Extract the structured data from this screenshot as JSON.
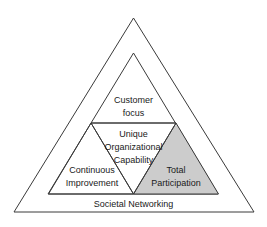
{
  "diagram": {
    "background_color": "#ffffff",
    "stroke_color": "#3a3a3a",
    "text_color": "#1a1a1a",
    "shaded_fill_color": "#cccccc",
    "outer_band": {
      "label": "Societal Networking"
    },
    "segments": [
      {
        "id": "customer-focus",
        "position": "top",
        "shaded": false,
        "lines": [
          "Customer",
          "focus"
        ]
      },
      {
        "id": "unique-organizational-capability",
        "position": "center-inverted",
        "shaded": false,
        "lines": [
          "Unique",
          "Organizational",
          "Capability"
        ]
      },
      {
        "id": "continuous-improvement",
        "position": "bottom-left",
        "shaded": false,
        "lines": [
          "Continuous",
          "Improvement"
        ]
      },
      {
        "id": "total-participation",
        "position": "bottom-right",
        "shaded": true,
        "lines": [
          "Total",
          "Participation"
        ]
      }
    ]
  }
}
